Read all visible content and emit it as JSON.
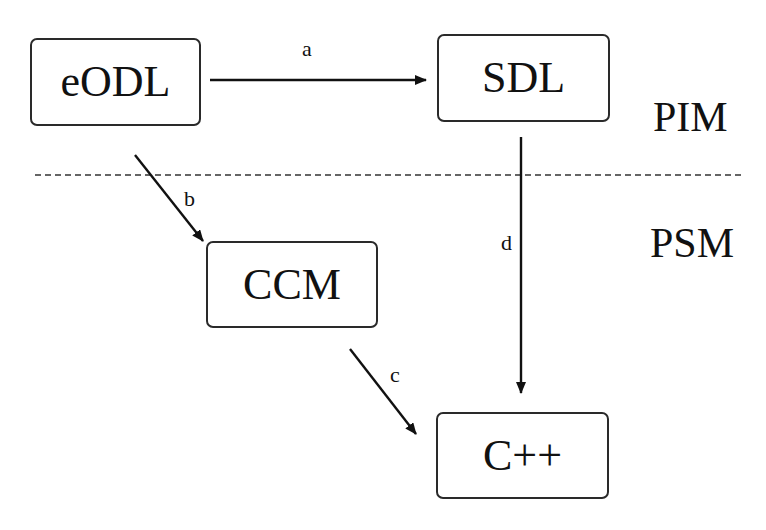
{
  "diagram": {
    "nodes": [
      {
        "id": "eodl",
        "label": "eODL",
        "x": 30,
        "y": 38,
        "w": 171,
        "h": 88
      },
      {
        "id": "sdl",
        "label": "SDL",
        "x": 437,
        "y": 34,
        "w": 173,
        "h": 88
      },
      {
        "id": "ccm",
        "label": "CCM",
        "x": 206,
        "y": 241,
        "w": 172,
        "h": 87
      },
      {
        "id": "cpp",
        "label": "C++",
        "x": 436,
        "y": 412,
        "w": 173,
        "h": 87
      }
    ],
    "edges": [
      {
        "id": "a",
        "label": "a",
        "from": "eODL",
        "to": "SDL"
      },
      {
        "id": "b",
        "label": "b",
        "from": "eODL",
        "to": "CCM"
      },
      {
        "id": "c",
        "label": "c",
        "from": "CCM",
        "to": "C++"
      },
      {
        "id": "d",
        "label": "d",
        "from": "SDL",
        "to": "C++"
      }
    ],
    "regions": {
      "upper": "PIM",
      "lower": "PSM"
    },
    "separator": "dashed"
  }
}
